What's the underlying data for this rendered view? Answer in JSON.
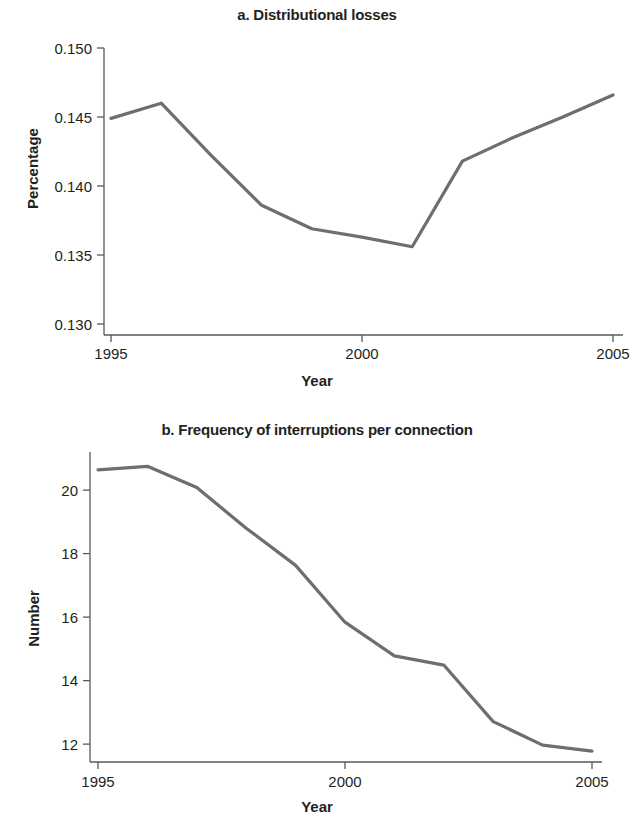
{
  "figure": {
    "background_color": "#ffffff",
    "line_color": "#6d6e71",
    "axis_color": "#58595b",
    "text_color": "#231f20"
  },
  "panels": [
    {
      "id": "a",
      "title": "a. Distributional losses",
      "xlabel": "Year",
      "ylabel": "Percentage"
    },
    {
      "id": "b",
      "title": "b. Frequency of interruptions per connection",
      "xlabel": "Year",
      "ylabel": "Number"
    }
  ],
  "chart_data": [
    {
      "type": "line",
      "title": "a. Distributional losses",
      "xlabel": "Year",
      "ylabel": "Percentage",
      "x": [
        1995,
        1996,
        1997,
        1998,
        1999,
        2000,
        2001,
        2002,
        2003,
        2004,
        2005
      ],
      "values": [
        0.1449,
        0.146,
        0.1422,
        0.1386,
        0.1369,
        0.1363,
        0.1356,
        0.1418,
        0.1435,
        0.145,
        0.1466
      ],
      "series": [
        {
          "name": "Distributional losses",
          "values": [
            0.1449,
            0.146,
            0.1422,
            0.1386,
            0.1369,
            0.1363,
            0.1356,
            0.1418,
            0.1435,
            0.145,
            0.1466
          ]
        }
      ],
      "xlim": [
        1995,
        2005
      ],
      "ylim": [
        0.13,
        0.15
      ],
      "xticks": [
        1995,
        2000,
        2005
      ],
      "xtick_labels": [
        "1995",
        "2000",
        "2005"
      ],
      "yticks": [
        0.13,
        0.135,
        0.14,
        0.145,
        0.15
      ],
      "ytick_labels": [
        "0.130",
        "0.135",
        "0.140",
        "0.145",
        "0.150"
      ],
      "grid": false,
      "legend": "none",
      "line_color": "#6d6e71"
    },
    {
      "type": "line",
      "title": "b. Frequency of interruptions per connection",
      "xlabel": "Year",
      "ylabel": "Number",
      "x": [
        1995,
        1996,
        1997,
        1998,
        1999,
        2000,
        2001,
        2002,
        2003,
        2004,
        2005
      ],
      "values": [
        20.64,
        20.75,
        20.08,
        18.8,
        17.63,
        15.84,
        14.78,
        14.49,
        12.71,
        11.97,
        11.78
      ],
      "series": [
        {
          "name": "Frequency of interruptions per connection",
          "values": [
            20.64,
            20.75,
            20.08,
            18.8,
            17.63,
            15.84,
            14.78,
            14.49,
            12.71,
            11.97,
            11.78
          ]
        }
      ],
      "xlim": [
        1995,
        2005
      ],
      "ylim": [
        11.5,
        21.2
      ],
      "xticks": [
        1995,
        2000,
        2005
      ],
      "xtick_labels": [
        "1995",
        "2000",
        "2005"
      ],
      "yticks": [
        12,
        14,
        16,
        18,
        20
      ],
      "ytick_labels": [
        "12",
        "14",
        "16",
        "18",
        "20"
      ],
      "grid": false,
      "legend": "none",
      "line_color": "#6d6e71"
    }
  ]
}
